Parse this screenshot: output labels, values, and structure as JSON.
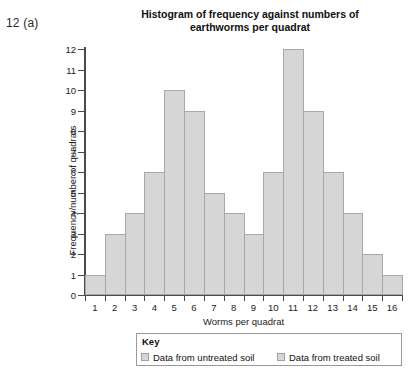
{
  "question_number": "12 (a)",
  "chart_data": {
    "type": "bar",
    "title": "Histogram of frequency against numbers of earthworms per quadrat",
    "xlabel": "Worms per quadrat",
    "ylabel": "Frequency/number of quadrats",
    "categories": [
      "1",
      "2",
      "3",
      "4",
      "5",
      "6",
      "7",
      "8",
      "9",
      "10",
      "11",
      "12",
      "13",
      "14",
      "15",
      "16"
    ],
    "values": [
      1,
      3,
      4,
      6,
      10,
      9,
      5,
      4,
      3,
      6,
      12,
      9,
      6,
      4,
      2,
      1
    ],
    "ylim": [
      0,
      12
    ],
    "y_ticks": [
      "0",
      "1",
      "2",
      "3",
      "4",
      "5",
      "6",
      "7",
      "8",
      "9",
      "10",
      "11",
      "12"
    ],
    "x_ticks": [
      "1",
      "2",
      "3",
      "4",
      "5",
      "6",
      "7",
      "8",
      "9",
      "10",
      "11",
      "12",
      "13",
      "14",
      "15",
      "16"
    ],
    "grid": false,
    "bar_fill": "#d6d6d6",
    "bar_border": "#a8a8a8",
    "axis_color": "#4a4a4a",
    "legend_position": "bottom",
    "legend": {
      "title": "Key",
      "entries": [
        {
          "label": "Data from untreated soil",
          "color": "#d6d6d6"
        },
        {
          "label": "Data from treated soil",
          "color": "#d6d6d6"
        }
      ]
    }
  }
}
